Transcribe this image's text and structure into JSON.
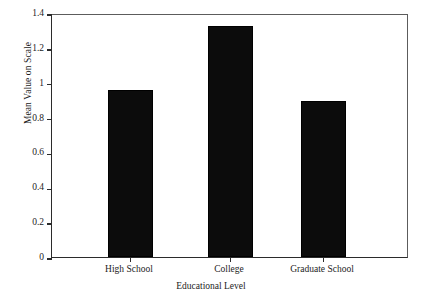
{
  "chart_data": {
    "type": "bar",
    "title": "",
    "categories": [
      "High School",
      "College",
      "Graduate School"
    ],
    "values": [
      0.96,
      1.325,
      0.895
    ],
    "xlabel": "Educational Level",
    "ylabel": "Mean Value on Scale",
    "ylim": [
      0,
      1.4
    ],
    "ytick_labels": [
      "0",
      "0.2",
      "0.4",
      "0.6",
      "0.8",
      "1",
      "1.2",
      "1.4"
    ],
    "ytick_values": [
      0,
      0.2,
      0.4,
      0.6,
      0.8,
      1,
      1.2,
      1.4
    ],
    "grid": false,
    "legend": null,
    "bar_color": "#0c0c0c",
    "axis_color": "#2b2b2b",
    "background_color": "#ffffff"
  }
}
